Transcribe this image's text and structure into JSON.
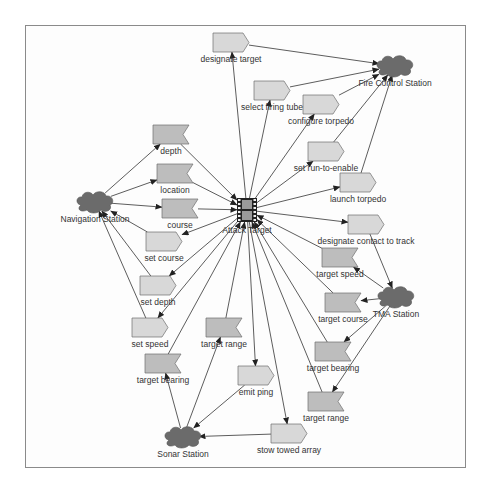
{
  "diagram": {
    "colors": {
      "background": "#ffffff",
      "frame": "#8a8a8a",
      "line": "#333333",
      "action_fill": "#d8d8d8",
      "data_fill": "#bdbdbd",
      "shape_stroke": "#6e6e6e",
      "station_fill": "#6b6b6b",
      "label": "#333333"
    },
    "center": {
      "id": "attack-target",
      "label": "Attack Target",
      "icon": "film-strip-icon",
      "x": 247,
      "y": 210
    },
    "stations": [
      {
        "id": "fire-control-station",
        "label": "Fire Control Station",
        "x": 395,
        "y": 66
      },
      {
        "id": "navigation-station",
        "label": "Navigation Station",
        "x": 95,
        "y": 202
      },
      {
        "id": "tma-station",
        "label": "TMA Station",
        "x": 396,
        "y": 297
      },
      {
        "id": "sonar-station",
        "label": "Sonar Station",
        "x": 183,
        "y": 437
      }
    ],
    "nodes": [
      {
        "id": "designate-target",
        "label": "designate target",
        "shape": "action",
        "x": 213,
        "y": 33
      },
      {
        "id": "select-firing-tube",
        "label": "select firing tube",
        "shape": "action",
        "x": 254,
        "y": 81
      },
      {
        "id": "configure-torpedo",
        "label": "configure torpedo",
        "shape": "action",
        "x": 303,
        "y": 95
      },
      {
        "id": "set-run-to-enable",
        "label": "set run-to-enable",
        "shape": "action",
        "x": 308,
        "y": 142
      },
      {
        "id": "launch-torpedo",
        "label": "launch torpedo",
        "shape": "action",
        "x": 340,
        "y": 173
      },
      {
        "id": "designate-contact-to-track",
        "label": "designate contact to track",
        "shape": "action",
        "x": 348,
        "y": 215
      },
      {
        "id": "target-speed-tma",
        "label": "target speed",
        "shape": "data",
        "x": 322,
        "y": 248
      },
      {
        "id": "target-course-tma",
        "label": "target course",
        "shape": "data",
        "x": 325,
        "y": 293
      },
      {
        "id": "target-bearing-tma",
        "label": "target bearing",
        "shape": "data",
        "x": 315,
        "y": 342
      },
      {
        "id": "target-range-tma",
        "label": "target range",
        "shape": "data",
        "x": 308,
        "y": 392
      },
      {
        "id": "stow-towed-array",
        "label": "stow towed array",
        "shape": "action",
        "x": 271,
        "y": 424
      },
      {
        "id": "emit-ping",
        "label": "emit ping",
        "shape": "action",
        "x": 238,
        "y": 366
      },
      {
        "id": "target-range-sonar",
        "label": "target range",
        "shape": "data",
        "x": 206,
        "y": 318
      },
      {
        "id": "target-bearing-sonar",
        "label": "target bearing",
        "shape": "data",
        "x": 145,
        "y": 354
      },
      {
        "id": "set-speed",
        "label": "set speed",
        "shape": "action",
        "x": 132,
        "y": 318
      },
      {
        "id": "set-depth",
        "label": "set depth",
        "shape": "action",
        "x": 140,
        "y": 276
      },
      {
        "id": "set-course",
        "label": "set course",
        "shape": "action",
        "x": 146,
        "y": 232
      },
      {
        "id": "course",
        "label": "course",
        "shape": "data",
        "x": 162,
        "y": 199
      },
      {
        "id": "location",
        "label": "location",
        "shape": "data",
        "x": 157,
        "y": 164
      },
      {
        "id": "depth",
        "label": "depth",
        "shape": "data",
        "x": 153,
        "y": 125
      }
    ],
    "edges": [
      {
        "from": "attack-target",
        "to": "designate-target"
      },
      {
        "from": "designate-target",
        "to": "fire-control-station"
      },
      {
        "from": "attack-target",
        "to": "select-firing-tube"
      },
      {
        "from": "select-firing-tube",
        "to": "fire-control-station"
      },
      {
        "from": "attack-target",
        "to": "configure-torpedo"
      },
      {
        "from": "configure-torpedo",
        "to": "fire-control-station"
      },
      {
        "from": "attack-target",
        "to": "set-run-to-enable"
      },
      {
        "from": "set-run-to-enable",
        "to": "fire-control-station"
      },
      {
        "from": "attack-target",
        "to": "launch-torpedo"
      },
      {
        "from": "launch-torpedo",
        "to": "fire-control-station"
      },
      {
        "from": "attack-target",
        "to": "designate-contact-to-track"
      },
      {
        "from": "designate-contact-to-track",
        "to": "tma-station"
      },
      {
        "from": "tma-station",
        "to": "target-speed-tma"
      },
      {
        "from": "target-speed-tma",
        "to": "attack-target"
      },
      {
        "from": "tma-station",
        "to": "target-course-tma"
      },
      {
        "from": "target-course-tma",
        "to": "attack-target"
      },
      {
        "from": "tma-station",
        "to": "target-bearing-tma"
      },
      {
        "from": "target-bearing-tma",
        "to": "attack-target"
      },
      {
        "from": "tma-station",
        "to": "target-range-tma"
      },
      {
        "from": "target-range-tma",
        "to": "attack-target"
      },
      {
        "from": "attack-target",
        "to": "stow-towed-array"
      },
      {
        "from": "stow-towed-array",
        "to": "sonar-station"
      },
      {
        "from": "attack-target",
        "to": "emit-ping"
      },
      {
        "from": "emit-ping",
        "to": "sonar-station"
      },
      {
        "from": "sonar-station",
        "to": "target-range-sonar"
      },
      {
        "from": "target-range-sonar",
        "to": "attack-target"
      },
      {
        "from": "sonar-station",
        "to": "target-bearing-sonar"
      },
      {
        "from": "target-bearing-sonar",
        "to": "attack-target"
      },
      {
        "from": "attack-target",
        "to": "set-speed"
      },
      {
        "from": "set-speed",
        "to": "navigation-station"
      },
      {
        "from": "attack-target",
        "to": "set-depth"
      },
      {
        "from": "set-depth",
        "to": "navigation-station"
      },
      {
        "from": "attack-target",
        "to": "set-course"
      },
      {
        "from": "set-course",
        "to": "navigation-station"
      },
      {
        "from": "navigation-station",
        "to": "course"
      },
      {
        "from": "course",
        "to": "attack-target"
      },
      {
        "from": "navigation-station",
        "to": "location"
      },
      {
        "from": "location",
        "to": "attack-target"
      },
      {
        "from": "navigation-station",
        "to": "depth"
      },
      {
        "from": "depth",
        "to": "attack-target"
      }
    ]
  }
}
